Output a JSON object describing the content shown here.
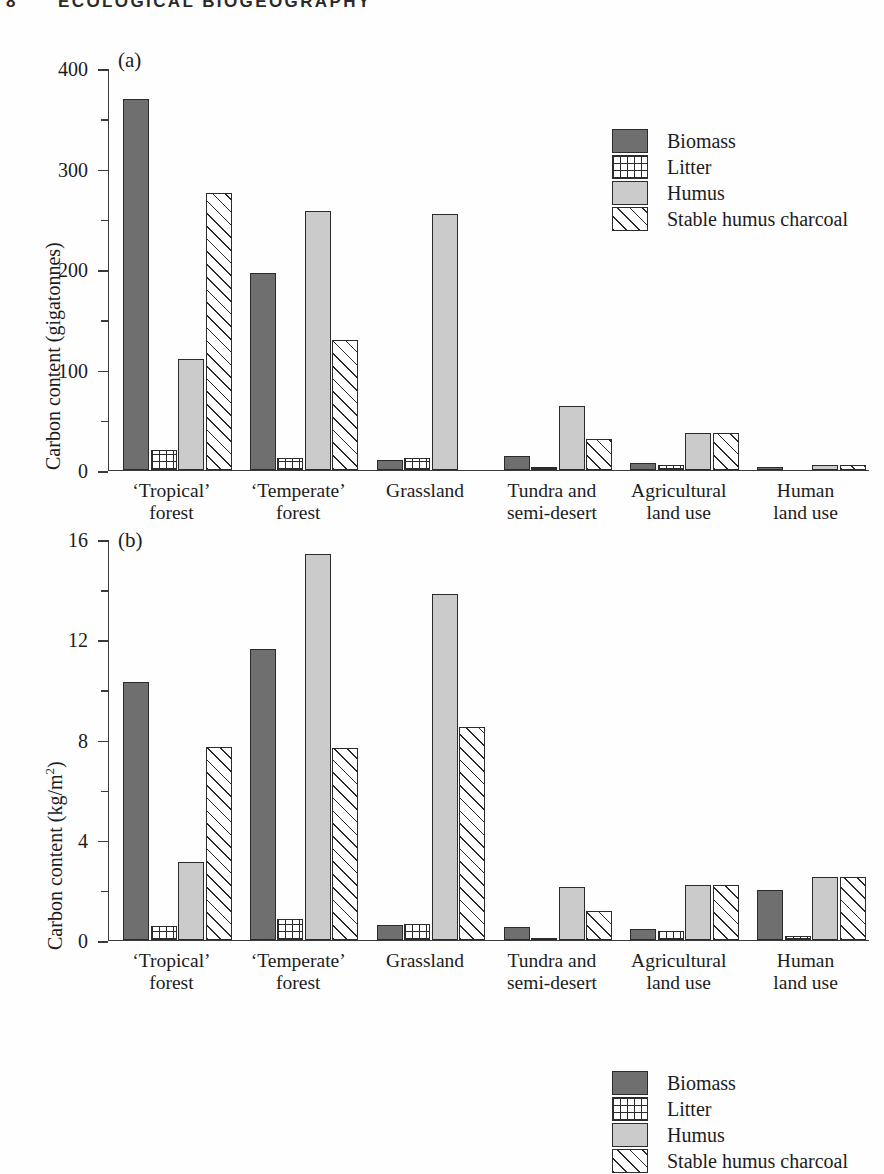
{
  "running_head": {
    "page_number": "8",
    "title": "ECOLOGICAL BIOGEOGRAPHY"
  },
  "legend": {
    "items": [
      {
        "label": "Biomass",
        "pattern": "solid-dark-gray",
        "swatch": "sw-biomass",
        "color": "#6f6f6f"
      },
      {
        "label": "Litter",
        "pattern": "grid-crosshatch",
        "swatch": "sw-litter",
        "color": "#ffffff"
      },
      {
        "label": "Humus",
        "pattern": "solid-light-gray",
        "swatch": "sw-humus",
        "color": "#cbcbcb"
      },
      {
        "label": "Stable humus charcoal",
        "pattern": "diagonal-hatch",
        "swatch": "sw-charcoal",
        "color": "#ffffff"
      }
    ]
  },
  "panels": [
    {
      "tag": "(a)",
      "ylabel_main": "Carbon content (gigatonnes)",
      "ylabel_sup": ""
    },
    {
      "tag": "(b)",
      "ylabel_main": "Carbon content (kg/m",
      "ylabel_sup": "2",
      "ylabel_tail": ")"
    }
  ],
  "categories": [
    {
      "line1": "‘Tropical’",
      "line2": "forest"
    },
    {
      "line1": "‘Temperate’",
      "line2": "forest"
    },
    {
      "line1": "Grassland",
      "line2": ""
    },
    {
      "line1": "Tundra and",
      "line2": "semi-desert"
    },
    {
      "line1": "Agricultural",
      "line2": "land use"
    },
    {
      "line1": "Human",
      "line2": "land use"
    }
  ],
  "chart_data": [
    {
      "type": "bar",
      "panel": "(a)",
      "title": "",
      "xlabel": "",
      "ylabel": "Carbon content (gigatonnes)",
      "ylim": [
        0,
        400
      ],
      "yticks": [
        0,
        100,
        200,
        300,
        400
      ],
      "ytick_labels": [
        "0",
        "100",
        "200",
        "300",
        "400"
      ],
      "yminor_ticks": [
        50,
        150,
        250,
        350
      ],
      "grid": false,
      "legend_position": "upper-right",
      "categories": [
        "‘Tropical’ forest",
        "‘Temperate’ forest",
        "Grassland",
        "Tundra and semi-desert",
        "Agricultural land use",
        "Human land use"
      ],
      "series": [
        {
          "name": "Biomass",
          "values": [
            369,
            196,
            10,
            14,
            7,
            3
          ]
        },
        {
          "name": "Litter",
          "values": [
            20,
            12,
            12,
            3,
            5,
            0
          ]
        },
        {
          "name": "Humus",
          "values": [
            110,
            258,
            255,
            64,
            37,
            5
          ]
        },
        {
          "name": "Stable humus charcoal",
          "values": [
            276,
            129,
            0,
            31,
            37,
            5
          ]
        }
      ]
    },
    {
      "type": "bar",
      "panel": "(b)",
      "title": "",
      "xlabel": "",
      "ylabel": "Carbon content (kg/m2)",
      "ylim": [
        0,
        16
      ],
      "yticks": [
        0,
        4,
        8,
        12,
        16
      ],
      "ytick_labels": [
        "0",
        "4",
        "8",
        "12",
        "16"
      ],
      "yminor_ticks": [
        2,
        6,
        10,
        14
      ],
      "grid": false,
      "legend_position": "upper-right",
      "categories": [
        "‘Tropical’ forest",
        "‘Temperate’ forest",
        "Grassland",
        "Tundra and semi-desert",
        "Agricultural land use",
        "Human land use"
      ],
      "series": [
        {
          "name": "Biomass",
          "values": [
            10.3,
            11.6,
            0.6,
            0.5,
            0.45,
            2.0
          ]
        },
        {
          "name": "Litter",
          "values": [
            0.55,
            0.85,
            0.65,
            0.1,
            0.35,
            0.15
          ]
        },
        {
          "name": "Humus",
          "values": [
            3.1,
            15.4,
            13.8,
            2.1,
            2.2,
            2.5
          ]
        },
        {
          "name": "Stable humus charcoal",
          "values": [
            7.7,
            7.65,
            8.5,
            1.15,
            2.2,
            2.5
          ]
        }
      ]
    }
  ]
}
